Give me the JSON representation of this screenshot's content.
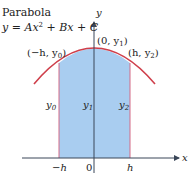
{
  "title": {
    "line1": "Parabola",
    "equation": {
      "lhs": "y",
      "eq": " = ",
      "A": "Ax",
      "exp": "2",
      "rest": " + Bx + C"
    }
  },
  "axes": {
    "x_label": "x",
    "y_label": "y",
    "ticks": {
      "neg_h": "−h",
      "zero": "0",
      "h": "h"
    }
  },
  "points": {
    "left": {
      "open": "(−h, y",
      "sub": "0",
      "close": ")"
    },
    "top": {
      "open": "(0, y",
      "sub": "1",
      "close": ")"
    },
    "right": {
      "open": "(h, y",
      "sub": "2",
      "close": ")"
    }
  },
  "ordinates": {
    "y0": {
      "base": "y",
      "sub": "0"
    },
    "y1": {
      "base": "y",
      "sub": "1"
    },
    "y2": {
      "base": "y",
      "sub": "2"
    }
  },
  "colors": {
    "curve": "#cf3f4b",
    "fill": "#a9cdf0",
    "edge": "#d46a86",
    "axis": "#4a5a72"
  }
}
